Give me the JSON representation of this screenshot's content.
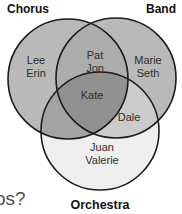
{
  "venn": {
    "set_labels": {
      "chorus": "Chorus",
      "band": "Band",
      "orchestra": "Orchestra"
    },
    "regions": {
      "chorus_only": {
        "members": [
          "Lee",
          "Erin"
        ]
      },
      "band_only": {
        "members": [
          "Marie",
          "Seth"
        ]
      },
      "orchestra_only": {
        "members": [
          "Juan",
          "Valerie"
        ]
      },
      "chorus_band": {
        "members": [
          "Pat",
          "Jon"
        ]
      },
      "band_orchestra": {
        "members": [
          "Dale"
        ]
      },
      "chorus_orchestra": {
        "members": []
      },
      "all_three": {
        "members": [
          "Kate"
        ]
      }
    }
  },
  "question_fragment": "os?",
  "colors": {
    "background": "#ffffff",
    "outline": "#1c1c1c",
    "chorus_only": "#b9b9b9",
    "band_only": "#b9b9b9",
    "orchestra_only": "#efefef",
    "chorus_band": "#adadad",
    "chorus_orchestra": "#a3a3a3",
    "band_orchestra": "#cbcbcb",
    "all_three": "#919191"
  }
}
